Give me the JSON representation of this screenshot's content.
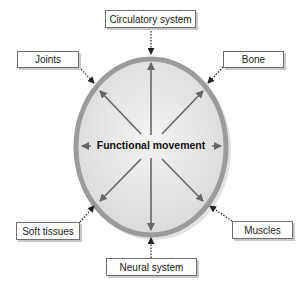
{
  "diagram": {
    "center_label": "Functional movement",
    "nodes": [
      {
        "id": "circulatory",
        "label": "Circulatory system",
        "position": "top"
      },
      {
        "id": "joints",
        "label": "Joints",
        "position": "top-left"
      },
      {
        "id": "bone",
        "label": "Bone",
        "position": "top-right"
      },
      {
        "id": "soft_tissues",
        "label": "Soft tissues",
        "position": "bottom-left"
      },
      {
        "id": "muscles",
        "label": "Muscles",
        "position": "bottom-right"
      },
      {
        "id": "neural",
        "label": "Neural system",
        "position": "bottom"
      }
    ],
    "colors": {
      "ring": "#9b9b9b",
      "fill_inner": "#f2f2f2",
      "fill_outer": "#d6d6d6",
      "arrow": "#666666",
      "connector": "#333333"
    }
  }
}
